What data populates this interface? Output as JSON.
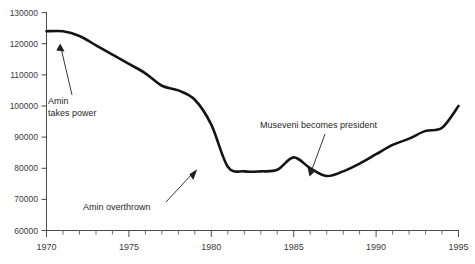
{
  "chart_data": {
    "type": "line",
    "title": "",
    "subtitle": "",
    "xlabel": "",
    "ylabel": "",
    "xlim": [
      1970,
      1995
    ],
    "ylim": [
      60000,
      130000
    ],
    "grid": false,
    "legend": "none",
    "x_ticks_labeled": [
      "1970",
      "1975",
      "1980",
      "1985",
      "1990",
      "1995"
    ],
    "x_tick_values": [
      1970,
      1975,
      1980,
      1985,
      1990,
      1995
    ],
    "x_minor_tick_step": 1,
    "y_ticks_labeled": [
      "60000",
      "70000",
      "80000",
      "90000",
      "100000",
      "110000",
      "120000",
      "130000"
    ],
    "y_tick_values": [
      60000,
      70000,
      80000,
      90000,
      100000,
      110000,
      120000,
      130000
    ],
    "series": [
      {
        "name": "population",
        "x": [
          1970,
          1971,
          1972,
          1973,
          1974,
          1975,
          1976,
          1977,
          1978,
          1979,
          1980,
          1981,
          1982,
          1983,
          1984,
          1985,
          1986,
          1987,
          1988,
          1989,
          1990,
          1991,
          1992,
          1993,
          1994,
          1995
        ],
        "values": [
          124000,
          124000,
          122500,
          119500,
          116500,
          113500,
          110500,
          106500,
          105000,
          102000,
          94000,
          80500,
          79000,
          79000,
          79500,
          83500,
          80000,
          77500,
          79000,
          81500,
          84500,
          87500,
          89500,
          92000,
          93000,
          100000
        ]
      }
    ],
    "annotations": [
      {
        "id": "amin-takes-power",
        "label": "Amin\ntakes power",
        "line1": "Amin",
        "line2": "takes power",
        "point_x": 1971,
        "point_y": 123500
      },
      {
        "id": "amin-overthrown",
        "label": "Amin overthrown",
        "line1": "Amin overthrown",
        "line2": "",
        "point_x": 1979.3,
        "point_y": 80500
      },
      {
        "id": "museveni-becomes-president",
        "label": "Museveni becomes president",
        "line1": "Museveni becomes president",
        "line2": "",
        "point_x": 1986.2,
        "point_y": 79800
      }
    ],
    "colors": {
      "series": "#141414",
      "axis": "#4a4a4a",
      "text": "#1f1f1f",
      "background": "#ffffff"
    }
  }
}
